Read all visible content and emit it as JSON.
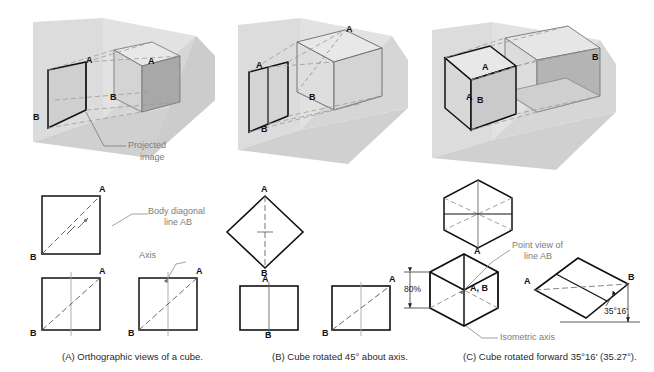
{
  "figure": {
    "panels": [
      {
        "id": "A",
        "caption": "(A) Orthographic views of a cube.",
        "annotations": [
          {
            "name": "projected-image",
            "text": "Projected\nimage",
            "line1": "Projected",
            "line2": "image"
          },
          {
            "name": "body-diagonal",
            "line1": "Body diagonal",
            "line2": "line AB"
          },
          {
            "name": "axis",
            "text": "Axis"
          }
        ],
        "vertex_labels": [
          "A",
          "B"
        ]
      },
      {
        "id": "B",
        "caption": "(B) Cube rotated 45° about axis.",
        "rotation": "45°",
        "vertex_labels": [
          "A",
          "B"
        ]
      },
      {
        "id": "C",
        "caption": "(C)  Cube rotated forward 35°16' (35.27°).",
        "rotation": "35°16'",
        "rotation_decimal": "35.27°",
        "annotations": [
          {
            "name": "point-view",
            "line1": "Point view of",
            "line2": "line AB"
          },
          {
            "name": "isometric-axis",
            "text": "Isometric axis"
          },
          {
            "name": "foreshorten",
            "text": "80%"
          },
          {
            "name": "angle",
            "text": "35°16'"
          }
        ],
        "vertex_labels": [
          "A",
          "B",
          "A, B"
        ]
      }
    ],
    "labels": {
      "A": "A",
      "B": "B",
      "AB": "A, B",
      "percent": "80%",
      "angle": "35°16'",
      "axis": "Axis",
      "isometric_axis": "Isometric axis",
      "projected_1": "Projected",
      "projected_2": "image",
      "body_diag_1": "Body diagonal",
      "body_diag_2": "line AB",
      "point_view_1": "Point view of",
      "point_view_2": "line AB"
    },
    "colors": {
      "outline": "#111111",
      "leader": "#8a8a8a",
      "plane_vertical": "#d8d8d8",
      "plane_horizontal": "#cfcfcf",
      "cube_top": "#e6e6e6",
      "cube_left": "#d2d2d2",
      "cube_right": "#a9a9a9",
      "dashed": "#9a9a9a",
      "background": "#ffffff"
    }
  }
}
